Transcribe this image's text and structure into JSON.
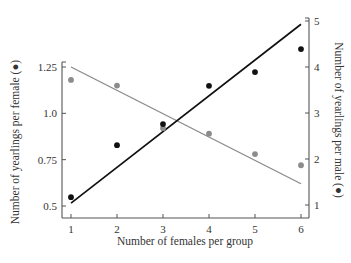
{
  "chart_data": {
    "type": "scatter",
    "title": "",
    "xlabel": "Number of females per group",
    "ylabel_left": "Number of yearlings per female (●)",
    "ylabel_right": "Number of yearlings per male (●)",
    "x_ticks": [
      "1",
      "2",
      "3",
      "4",
      "5",
      "6"
    ],
    "y_left_ticks": [
      "0.5",
      "0.75",
      "1.0",
      "1.25"
    ],
    "y_right_ticks": [
      "1",
      "2",
      "3",
      "4",
      "5"
    ],
    "xlim": [
      1,
      6
    ],
    "ylim_left": [
      0.5,
      1.25
    ],
    "ylim_right": [
      1,
      5
    ],
    "grid": false,
    "legend": "none (marker color indicated in axis titles)",
    "series": [
      {
        "name": "Yearlings per female",
        "axis": "left",
        "marker_color": "#8c8c8c",
        "line_color": "#8a8a8a",
        "x": [
          1,
          2,
          3,
          4,
          5,
          6
        ],
        "values": [
          1.18,
          1.15,
          0.92,
          0.89,
          0.78,
          0.72
        ],
        "trend_line": {
          "x": [
            1,
            6
          ],
          "y": [
            1.25,
            0.62
          ]
        }
      },
      {
        "name": "Yearlings per male",
        "axis": "right",
        "marker_color": "#111111",
        "line_color": "#111111",
        "x": [
          1,
          2,
          3,
          4,
          5,
          6
        ],
        "values": [
          1.17,
          2.3,
          2.76,
          3.59,
          3.89,
          4.39
        ],
        "trend_line": {
          "x": [
            1,
            6
          ],
          "y": [
            1.04,
            4.93
          ]
        }
      }
    ]
  }
}
